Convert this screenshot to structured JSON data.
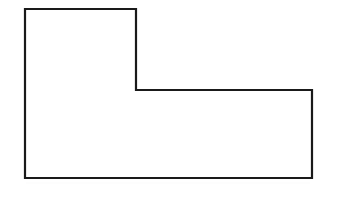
{
  "figure": {
    "kind": "line-drawing",
    "background_color": "#ffffff",
    "stroke_color": "#1a1a1a",
    "fill_color": "#ffffff",
    "stroke_width": 2.2,
    "canvas": {
      "width": 340,
      "height": 199
    }
  },
  "shape": {
    "name": "l-shape",
    "sides": 6,
    "closed": true,
    "points_attr": "25,9 136,9 136,90 312,90 312,178 25,178",
    "vertices": [
      {
        "label": "top-left",
        "x": 25,
        "y": 9
      },
      {
        "label": "top-right-of-upper-arm",
        "x": 136,
        "y": 9
      },
      {
        "label": "inner-notch-corner",
        "x": 136,
        "y": 90
      },
      {
        "label": "right-top",
        "x": 312,
        "y": 90
      },
      {
        "label": "bottom-right",
        "x": 312,
        "y": 178
      },
      {
        "label": "bottom-left",
        "x": 25,
        "y": 178
      }
    ],
    "edges": [
      {
        "name": "top-edge",
        "from": "top-left",
        "to": "top-right-of-upper-arm",
        "orientation": "horizontal",
        "length": 111
      },
      {
        "name": "upper-right-edge",
        "from": "top-right-of-upper-arm",
        "to": "inner-notch-corner",
        "orientation": "vertical",
        "length": 81
      },
      {
        "name": "notch-edge",
        "from": "inner-notch-corner",
        "to": "right-top",
        "orientation": "horizontal",
        "length": 176
      },
      {
        "name": "right-edge",
        "from": "right-top",
        "to": "bottom-right",
        "orientation": "vertical",
        "length": 88
      },
      {
        "name": "bottom-edge",
        "from": "bottom-right",
        "to": "bottom-left",
        "orientation": "horizontal",
        "length": 287
      },
      {
        "name": "left-edge",
        "from": "bottom-left",
        "to": "top-left",
        "orientation": "vertical",
        "length": 169
      }
    ]
  }
}
